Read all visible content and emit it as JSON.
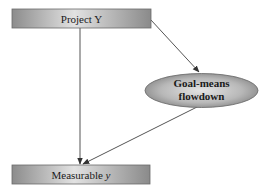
{
  "diagram": {
    "nodes": {
      "project_y": {
        "label": "Project Y",
        "shape": "rectangle"
      },
      "goal_means": {
        "line1": "Goal-means",
        "line2": "flowdown",
        "shape": "ellipse"
      },
      "measurable_y": {
        "label": "Measurable ",
        "label_italic": "y",
        "shape": "rectangle"
      }
    },
    "edges": [
      {
        "from": "Project Y",
        "to": "Measurable y"
      },
      {
        "from": "Project Y",
        "to": "Goal-means flowdown"
      },
      {
        "from": "Goal-means flowdown",
        "to": "Measurable y"
      }
    ],
    "colors": {
      "box_dark": "#8a8a8a",
      "box_light": "#e0e0e0",
      "line": "#555555"
    }
  }
}
